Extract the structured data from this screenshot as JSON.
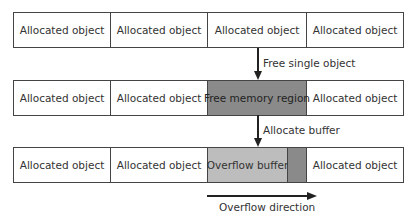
{
  "rows": [
    {
      "cells": [
        {
          "label": "Allocated object"
        },
        {
          "label": "Allocated object"
        },
        {
          "label": "Allocated object"
        },
        {
          "label": "Allocated object"
        }
      ]
    },
    {
      "cells": [
        {
          "label": "Allocated object"
        },
        {
          "label": "Allocated object"
        },
        {
          "label": "Free memory region"
        },
        {
          "label": "Allocated object"
        }
      ]
    },
    {
      "cells": [
        {
          "label": "Allocated object"
        },
        {
          "label": "Allocated object"
        },
        {
          "label": "Overflow buffer"
        },
        {
          "label": ""
        },
        {
          "label": "Allocated object"
        }
      ]
    }
  ],
  "transitions": {
    "step1": "Free single object",
    "step2": "Allocate buffer"
  },
  "overflow_direction_label": "Overflow direction",
  "colors": {
    "free_region": "#8a8a8a",
    "overflow_buffer": "#bdbdbd",
    "border": "#444444"
  }
}
